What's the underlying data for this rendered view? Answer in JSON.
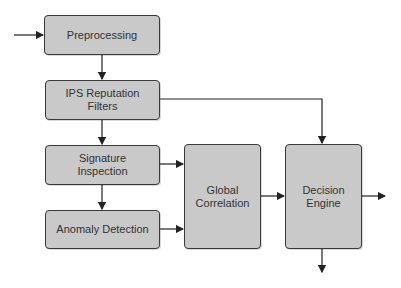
{
  "diagram": {
    "nodes": [
      {
        "id": "preprocessing",
        "label": "Preprocessing"
      },
      {
        "id": "ips-reputation-filters",
        "label": "IPS Reputation\nFilters"
      },
      {
        "id": "signature-inspection",
        "label": "Signature\nInspection"
      },
      {
        "id": "anomaly-detection",
        "label": "Anomaly Detection"
      },
      {
        "id": "global-correlation",
        "label": "Global\nCorrelation"
      },
      {
        "id": "decision-engine",
        "label": "Decision\nEngine"
      }
    ],
    "edges": [
      {
        "from": "input",
        "to": "preprocessing"
      },
      {
        "from": "preprocessing",
        "to": "ips-reputation-filters"
      },
      {
        "from": "ips-reputation-filters",
        "to": "signature-inspection"
      },
      {
        "from": "ips-reputation-filters",
        "to": "decision-engine"
      },
      {
        "from": "signature-inspection",
        "to": "anomaly-detection"
      },
      {
        "from": "signature-inspection",
        "to": "global-correlation"
      },
      {
        "from": "anomaly-detection",
        "to": "global-correlation"
      },
      {
        "from": "global-correlation",
        "to": "decision-engine"
      },
      {
        "from": "decision-engine",
        "to": "output-right"
      },
      {
        "from": "decision-engine",
        "to": "output-down"
      }
    ],
    "colors": {
      "box_fill": "#c9c9c9",
      "border": "#3a3a3a",
      "text": "#333333"
    }
  }
}
